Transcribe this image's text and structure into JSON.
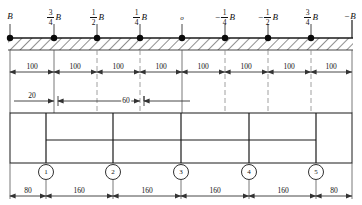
{
  "drawing": {
    "title": "beam-influence-line-and-column-layout",
    "colors": {
      "line": "#1a1a1a",
      "hatch": "#333333",
      "dim": "#333333",
      "dash": "#777777",
      "background": "#ffffff"
    }
  },
  "top_labels": [
    {
      "id": "b-left",
      "sign": "",
      "fraction": null,
      "symbol": "B",
      "x": 10
    },
    {
      "id": "b-3-4",
      "sign": "",
      "fraction": {
        "num": "3",
        "den": "4"
      },
      "symbol": "B",
      "x": 54
    },
    {
      "id": "b-1-2",
      "sign": "",
      "fraction": {
        "num": "1",
        "den": "2"
      },
      "symbol": "B",
      "x": 97
    },
    {
      "id": "b-1-4",
      "sign": "",
      "fraction": {
        "num": "1",
        "den": "4"
      },
      "symbol": "B",
      "x": 140
    },
    {
      "id": "origin",
      "sign": "",
      "fraction": null,
      "symbol": "o",
      "x": 182
    },
    {
      "id": "b-neg-1-4",
      "sign": "−",
      "fraction": {
        "num": "1",
        "den": "4"
      },
      "symbol": "B",
      "x": 225
    },
    {
      "id": "b-neg-1-2",
      "sign": "−",
      "fraction": {
        "num": "1",
        "den": "2"
      },
      "symbol": "B",
      "x": 268
    },
    {
      "id": "b-neg-3-4",
      "sign": "",
      "fraction": {
        "num": "3",
        "den": "4"
      },
      "symbol": "B",
      "x": 311
    },
    {
      "id": "b-right",
      "sign": "−",
      "fraction": null,
      "symbol": "B",
      "x": 350
    }
  ],
  "nodes": {
    "count": 9,
    "x_positions": [
      10,
      54,
      97,
      140,
      182,
      225,
      268,
      311,
      352
    ],
    "radius": 3.2
  },
  "beam": {
    "top_y": 38,
    "bottom_y": 50,
    "left_x": 8,
    "right_x": 353,
    "hatch_label": "hatched-support-band"
  },
  "dimension_chain_100": {
    "label_y": 62,
    "line_y": 72,
    "values": [
      "100",
      "100",
      "100",
      "100",
      "100",
      "100",
      "100",
      "100"
    ],
    "ticks": [
      10,
      54,
      97,
      140,
      182,
      225,
      268,
      311,
      352
    ]
  },
  "detail_dimensions": {
    "line_y": 101,
    "items": [
      {
        "id": "dim-20",
        "value": "20",
        "from": 10,
        "to": 54,
        "label_x": 32,
        "style": "leader-right"
      },
      {
        "id": "dim-60",
        "value": "60",
        "from": 54,
        "to": 140,
        "label_x": 120,
        "style": "gap-arrows"
      }
    ]
  },
  "plan": {
    "outer": {
      "x": 10,
      "y": 113,
      "width": 342,
      "height": 50
    },
    "inner_beam_y": 140,
    "inner_beam_from": 46,
    "inner_beam_to": 316,
    "columns_x": [
      46,
      113,
      181,
      249,
      316
    ],
    "column_top_y": 113,
    "column_bottom_y": 163
  },
  "column_markers": [
    {
      "id": "col-1",
      "label": "1",
      "x": 46
    },
    {
      "id": "col-2",
      "label": "2",
      "x": 113
    },
    {
      "id": "col-3",
      "label": "3",
      "x": 181
    },
    {
      "id": "col-4",
      "label": "4",
      "x": 249
    },
    {
      "id": "col-5",
      "label": "5",
      "x": 316
    }
  ],
  "bottom_dimensions": {
    "label_y": 186,
    "line_y": 196,
    "ticks": [
      10,
      46,
      113,
      181,
      249,
      316,
      352
    ],
    "values": [
      "80",
      "160",
      "160",
      "160",
      "160",
      "80"
    ]
  }
}
